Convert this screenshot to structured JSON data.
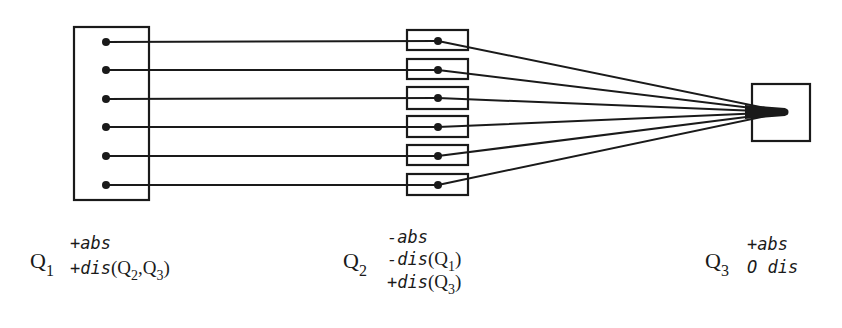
{
  "diagram": {
    "stroke_color": "#1a1a1a",
    "background": "#ffffff",
    "lines_per_group": 6,
    "nodes": {
      "q1": {
        "symbol": "Q",
        "index": "1",
        "terms": [
          {
            "sign": "+",
            "word": "abs"
          },
          {
            "sign": "+",
            "word": "dis",
            "args": [
              {
                "q": "Q",
                "i": "2"
              },
              {
                "q": "Q",
                "i": "3"
              }
            ]
          }
        ]
      },
      "q2": {
        "symbol": "Q",
        "index": "2",
        "terms": [
          {
            "sign": "-",
            "word": "abs"
          },
          {
            "sign": "-",
            "word": "dis",
            "args": [
              {
                "q": "Q",
                "i": "1"
              }
            ]
          },
          {
            "sign": "+",
            "word": "dis",
            "args": [
              {
                "q": "Q",
                "i": "3"
              }
            ]
          }
        ]
      },
      "q3": {
        "symbol": "Q",
        "index": "3",
        "terms": [
          {
            "sign": "+",
            "word": "abs"
          },
          {
            "sign": "O",
            "word": "dis"
          }
        ]
      }
    },
    "labels": {
      "q1_line1": "+abs",
      "q1_line2_prefix": "+dis",
      "q2_line1": "-abs",
      "q2_line2_prefix": "-dis",
      "q2_line3_prefix": "+dis",
      "q3_line1": "+abs",
      "q3_line2": "O dis",
      "open_paren": "(",
      "close_paren": ")",
      "comma": ","
    }
  }
}
